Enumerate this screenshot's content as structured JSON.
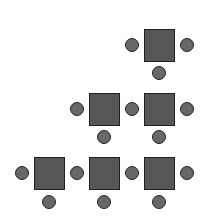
{
  "diagram": {
    "title": "",
    "colors": {
      "table_fill": "#575757",
      "table_border": "#1f1f1f",
      "chair_fill": "#686868",
      "chair_border": "#222222",
      "background": "#ffffff"
    },
    "tables": [
      {
        "id": "table-r1-c3",
        "row": 1,
        "col": 3,
        "x": 144,
        "y": 29
      },
      {
        "id": "table-r2-c2",
        "row": 2,
        "col": 2,
        "x": 89,
        "y": 93
      },
      {
        "id": "table-r2-c3",
        "row": 2,
        "col": 3,
        "x": 144,
        "y": 93
      },
      {
        "id": "table-r3-c1",
        "row": 3,
        "col": 1,
        "x": 34,
        "y": 157
      },
      {
        "id": "table-r3-c2",
        "row": 3,
        "col": 2,
        "x": 89,
        "y": 157
      },
      {
        "id": "table-r3-c3",
        "row": 3,
        "col": 3,
        "x": 144,
        "y": 157
      }
    ],
    "chairs": [
      {
        "x": 132,
        "y": 45
      },
      {
        "x": 187,
        "y": 45
      },
      {
        "x": 159,
        "y": 73
      },
      {
        "x": 77,
        "y": 109
      },
      {
        "x": 132,
        "y": 109
      },
      {
        "x": 187,
        "y": 109
      },
      {
        "x": 104,
        "y": 137
      },
      {
        "x": 159,
        "y": 137
      },
      {
        "x": 22,
        "y": 173
      },
      {
        "x": 77,
        "y": 173
      },
      {
        "x": 132,
        "y": 173
      },
      {
        "x": 187,
        "y": 173
      },
      {
        "x": 49,
        "y": 202
      },
      {
        "x": 104,
        "y": 202
      },
      {
        "x": 159,
        "y": 202
      }
    ]
  }
}
